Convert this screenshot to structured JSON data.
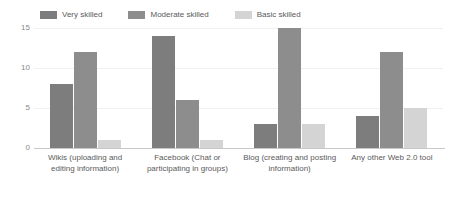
{
  "chart_data": {
    "type": "bar",
    "title": "",
    "subtitle": "",
    "xlabel": "",
    "ylabel": "",
    "ylim": [
      0,
      15
    ],
    "yticks": [
      0,
      5,
      10,
      15
    ],
    "ytick_labels": [
      "0",
      "5",
      "10",
      "15"
    ],
    "grid": true,
    "legend_position": "top",
    "categories": [
      "Wikis (uploading and editing information)",
      "Facebook (Chat or participating in groups)",
      "Blog (creating and posting information)",
      "Any other Web 2.0 tool"
    ],
    "series": [
      {
        "name": "Very skilled",
        "color": "#7d7d7d",
        "values": [
          8,
          14,
          3,
          4
        ]
      },
      {
        "name": "Moderate skilled",
        "color": "#8d8d8d",
        "values": [
          12,
          6,
          15,
          12
        ]
      },
      {
        "name": "Basic skilled",
        "color": "#d4d4d4",
        "values": [
          1,
          1,
          3,
          5
        ]
      }
    ]
  },
  "colors": {
    "very_skilled": "#7d7d7d",
    "moderate_skilled": "#8d8d8d",
    "basic_skilled": "#d4d4d4",
    "gridline": "#f0f0f0",
    "axis": "#c9c9c9",
    "text": "#5a5a5a",
    "tick_text": "#8a8a8a",
    "background": "#ffffff"
  }
}
